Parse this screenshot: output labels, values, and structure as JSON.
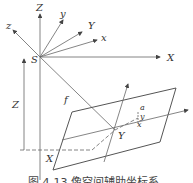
{
  "figure": {
    "labels": {
      "Z_axis": "Z",
      "z_axis": "z",
      "y_axis": "y",
      "Y_axis": "Y",
      "x_axis": "x",
      "X_axis": "X",
      "origin": "S",
      "height": "Z",
      "focal": "f",
      "ground_X": "X",
      "ground_Y": "Y",
      "point_a": "a",
      "img_y": "y",
      "img_x": "x"
    },
    "caption": "图 4-13  像空间辅助坐标系",
    "colors": {
      "line": "#555555",
      "text": "#333333",
      "background": "#ffffff"
    }
  }
}
